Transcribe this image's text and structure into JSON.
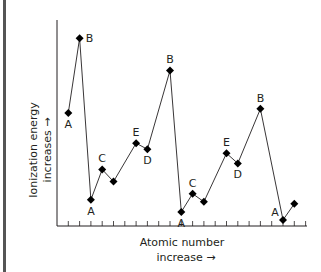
{
  "chart_data": {
    "type": "line",
    "title": "",
    "xlabel": "Atomic number increase →",
    "ylabel": "Ionization energy increases →",
    "xlabel_lines": [
      "Atomic number",
      "increase →"
    ],
    "ylabel_lines": [
      "Ionization energy",
      "increases →"
    ],
    "grid": false,
    "x_ticks_count": 22,
    "points": [
      {
        "x": 1,
        "y": 55,
        "label": "A"
      },
      {
        "x": 2,
        "y": 92,
        "label": "B"
      },
      {
        "x": 3,
        "y": 12,
        "label": "A"
      },
      {
        "x": 4,
        "y": 27,
        "label": "C"
      },
      {
        "x": 5,
        "y": 21,
        "label": ""
      },
      {
        "x": 7,
        "y": 40,
        "label": "E"
      },
      {
        "x": 8,
        "y": 37,
        "label": "D"
      },
      {
        "x": 10,
        "y": 76,
        "label": "B"
      },
      {
        "x": 11,
        "y": 6,
        "label": "A"
      },
      {
        "x": 12,
        "y": 15,
        "label": "C"
      },
      {
        "x": 13,
        "y": 11,
        "label": ""
      },
      {
        "x": 15,
        "y": 35,
        "label": "E"
      },
      {
        "x": 16,
        "y": 30,
        "label": "D"
      },
      {
        "x": 18,
        "y": 57,
        "label": "B"
      },
      {
        "x": 20,
        "y": 2,
        "label": "A"
      },
      {
        "x": 21,
        "y": 10,
        "label": ""
      }
    ]
  },
  "axis": {
    "x_label_line1": "Atomic number",
    "x_label_line2": "increase →",
    "y_label_line1": "Ionization energy",
    "y_label_line2": "increases →"
  }
}
